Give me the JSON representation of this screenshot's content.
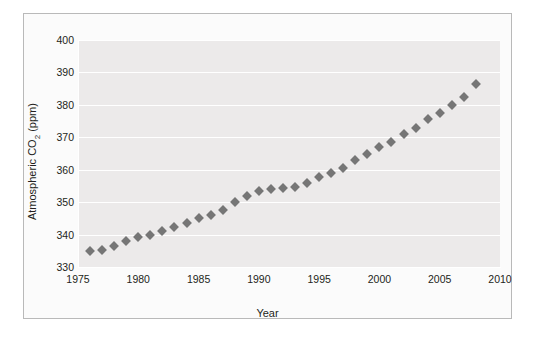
{
  "figure": {
    "background_color": "#ffffff",
    "panel_color": "#fbfbfb",
    "plot_background_color": "#eceaea",
    "gridline_color": "#ffffff",
    "marker_color": "#767676",
    "text_color": "#231f20"
  },
  "axis": {
    "y_label_text": "Atmospheric CO",
    "y_label_sub": "2",
    "y_label_suffix": " (ppm)",
    "x_label": "Year",
    "y_ticks": [
      "400",
      "390",
      "380",
      "370",
      "360",
      "350",
      "340",
      "330"
    ],
    "x_ticks": [
      "1975",
      "1980",
      "1985",
      "1990",
      "1995",
      "2000",
      "2005",
      "2010"
    ]
  },
  "chart_data": {
    "type": "scatter",
    "title": "",
    "xlabel": "Year",
    "ylabel": "Atmospheric CO2 (ppm)",
    "xlim": [
      1975,
      2010
    ],
    "ylim": [
      330,
      400
    ],
    "xticks": [
      1975,
      1980,
      1985,
      1990,
      1995,
      2000,
      2005,
      2010
    ],
    "yticks": [
      330,
      340,
      350,
      360,
      370,
      380,
      390,
      400
    ],
    "grid": true,
    "legend": "none",
    "marker": "diamond",
    "marker_color": "#767676",
    "series": [
      {
        "name": "Atmospheric CO2",
        "x": [
          1976,
          1977,
          1978,
          1979,
          1980,
          1981,
          1982,
          1983,
          1984,
          1985,
          1986,
          1987,
          1988,
          1989,
          1990,
          1991,
          1992,
          1993,
          1994,
          1995,
          1996,
          1997,
          1998,
          1999,
          2000,
          2001,
          2002,
          2003,
          2004,
          2005,
          2006,
          2007,
          2008
        ],
        "y": [
          334.8,
          335.3,
          336.6,
          338.0,
          339.2,
          340.0,
          341.2,
          342.3,
          343.7,
          345.0,
          346.1,
          347.6,
          350.0,
          352.0,
          353.5,
          354.2,
          354.5,
          354.6,
          356.0,
          357.8,
          359.0,
          360.5,
          363.0,
          365.0,
          367.0,
          368.5,
          371.0,
          373.0,
          375.5,
          377.5,
          380.0,
          382.5,
          386.5
        ]
      }
    ]
  }
}
